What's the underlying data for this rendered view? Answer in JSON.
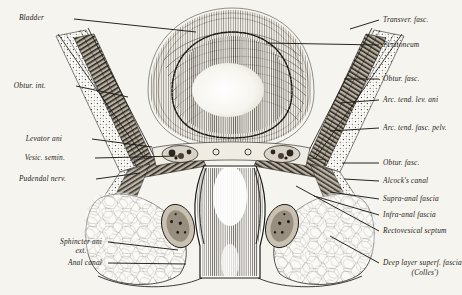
{
  "figure": {
    "background_color": "#f6f4ef",
    "ink_color": "#1d1a16"
  },
  "labels_left": [
    {
      "id": "bladder",
      "text": "Bladder",
      "x": 44,
      "y": 18,
      "lx": 74,
      "ly": 19,
      "tx": 196,
      "ty": 32
    },
    {
      "id": "obtur-int",
      "text": "Obtur. int.",
      "x": 46,
      "y": 86,
      "lx": 76,
      "ly": 86,
      "tx": 128,
      "ty": 97
    },
    {
      "id": "levator-ani",
      "text": "Levator ani",
      "x": 62,
      "y": 139,
      "lx": 92,
      "ly": 139,
      "tx": 152,
      "ty": 147
    },
    {
      "id": "vesic-semin",
      "text": "Vesic. semin.",
      "x": 65,
      "y": 158,
      "lx": 95,
      "ly": 158,
      "tx": 178,
      "ty": 156
    },
    {
      "id": "pudendal-nerv",
      "text": "Pudendal nerv.",
      "x": 66,
      "y": 179,
      "lx": 96,
      "ly": 179,
      "tx": 140,
      "ty": 173
    },
    {
      "id": "sphincter-ani",
      "text": "Sphincter ani",
      "x": 102,
      "y": 242,
      "lx": 108,
      "ly": 242,
      "tx": 178,
      "ty": 250
    },
    {
      "id": "sphincter-ani-2",
      "text": "ext.",
      "x": 81,
      "y": 251,
      "lx": null,
      "ly": null,
      "tx": null,
      "ty": null
    },
    {
      "id": "anal-canal",
      "text": "Anal canal",
      "x": 102,
      "y": 263,
      "lx": 108,
      "ly": 263,
      "tx": 186,
      "ty": 264
    }
  ],
  "labels_right": [
    {
      "id": "transver-fasc",
      "text": "Transver. fasc.",
      "x": 383,
      "y": 20,
      "lx": 379,
      "ly": 20,
      "tx": 350,
      "ty": 29
    },
    {
      "id": "peritoneum",
      "text": "Peritoneum",
      "x": 383,
      "y": 45,
      "lx": 379,
      "ly": 45,
      "tx": 266,
      "ty": 43
    },
    {
      "id": "obtur-fasc-upper",
      "text": "Obtur. fasc.",
      "x": 383,
      "y": 79,
      "lx": 379,
      "ly": 79,
      "tx": 344,
      "ty": 79
    },
    {
      "id": "arc-tend-lev-ani",
      "text": "Arc. tend. lev. ani",
      "x": 383,
      "y": 100,
      "lx": 379,
      "ly": 100,
      "tx": 340,
      "ty": 103
    },
    {
      "id": "arc-tend-fasc-pelv",
      "text": "Arc. tend. fasc. pelv.",
      "x": 383,
      "y": 128,
      "lx": 379,
      "ly": 128,
      "tx": 330,
      "ty": 131
    },
    {
      "id": "obtur-fasc-lower",
      "text": "Obtur. fasc.",
      "x": 383,
      "y": 163,
      "lx": 379,
      "ly": 163,
      "tx": 342,
      "ty": 163
    },
    {
      "id": "alcocks-canal",
      "text": "Alcock's canal",
      "x": 383,
      "y": 181,
      "lx": 379,
      "ly": 181,
      "tx": 344,
      "ty": 179
    },
    {
      "id": "supra-anal-fascia",
      "text": "Supra-anal fascia",
      "x": 383,
      "y": 199,
      "lx": 379,
      "ly": 199,
      "tx": 330,
      "ty": 192
    },
    {
      "id": "infra-anal-fascia",
      "text": "Infra-anal fascia",
      "x": 383,
      "y": 215,
      "lx": 379,
      "ly": 215,
      "tx": 314,
      "ty": 196
    },
    {
      "id": "rectovesical-septum",
      "text": "Rectovesical septum",
      "x": 383,
      "y": 231,
      "lx": 379,
      "ly": 231,
      "tx": 296,
      "ty": 186
    },
    {
      "id": "colles-fascia",
      "text": "Deep layer superf. fascia",
      "x": 383,
      "y": 263,
      "lx": 379,
      "ly": 263,
      "tx": 330,
      "ty": 236
    },
    {
      "id": "colles-fascia-2",
      "text": "(Colles')",
      "x": 425,
      "y": 273,
      "lx": null,
      "ly": null,
      "tx": null,
      "ty": null
    }
  ]
}
